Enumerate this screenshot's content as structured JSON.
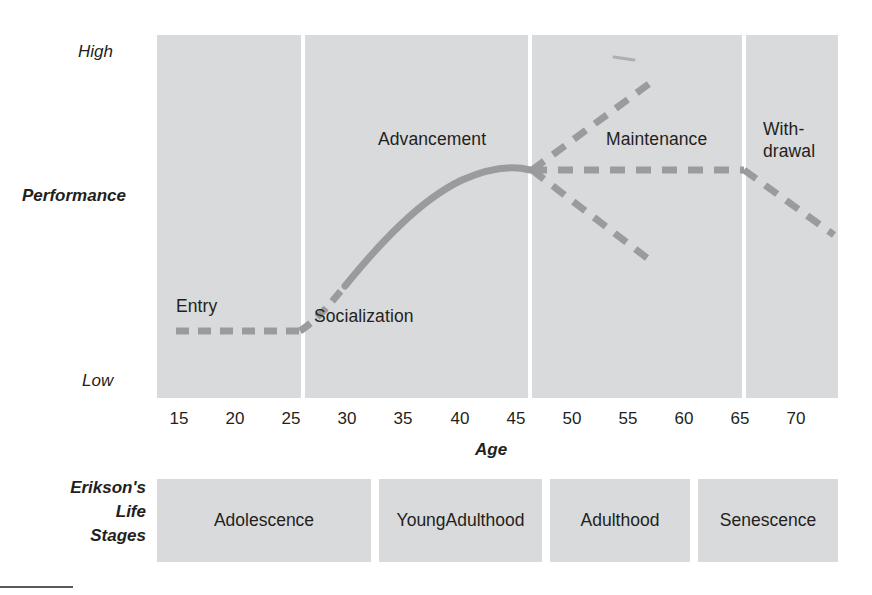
{
  "chart_data": {
    "type": "line",
    "title": "",
    "xlabel": "Age",
    "ylabel": "Performance",
    "xlim": [
      13,
      73
    ],
    "ylim": [
      0,
      1
    ],
    "x_ticks": [
      "15",
      "20",
      "25",
      "30",
      "35",
      "40",
      "45",
      "50",
      "55",
      "60",
      "65",
      "70"
    ],
    "y_ticks": [
      "High",
      "Low"
    ],
    "grid": false,
    "legend": "none",
    "annotations": [
      {
        "label": "Entry",
        "age_range": [
          15,
          25
        ]
      },
      {
        "label": "Socialization",
        "age_range": [
          25,
          30
        ]
      },
      {
        "label": "Advancement",
        "age_range": [
          25,
          45
        ]
      },
      {
        "label": "Maintenance",
        "age_range": [
          45,
          65
        ]
      },
      {
        "label": "With-\ndrawal",
        "age_range": [
          65,
          73
        ]
      }
    ],
    "career_boundaries": [
      25,
      45,
      65
    ],
    "series": [
      {
        "name": "Entry",
        "style": "dashed",
        "points": [
          [
            15,
            0.18
          ],
          [
            25,
            0.18
          ]
        ]
      },
      {
        "name": "Socialization / Advancement",
        "style": "dashed-to-solid",
        "points": [
          [
            25,
            0.18
          ],
          [
            30,
            0.4
          ],
          [
            35,
            0.58
          ],
          [
            40,
            0.7
          ],
          [
            45,
            0.745
          ]
        ]
      },
      {
        "name": "Maintenance - growth",
        "style": "dashed",
        "points": [
          [
            45,
            0.745
          ],
          [
            56,
            0.98
          ]
        ]
      },
      {
        "name": "Maintenance - plateau",
        "style": "dashed",
        "points": [
          [
            45,
            0.745
          ],
          [
            65,
            0.745
          ]
        ]
      },
      {
        "name": "Maintenance - decline",
        "style": "dashed",
        "points": [
          [
            45,
            0.745
          ],
          [
            56,
            0.5
          ]
        ]
      },
      {
        "name": "Withdrawal",
        "style": "dashed",
        "points": [
          [
            65,
            0.745
          ],
          [
            72.5,
            0.54
          ]
        ]
      }
    ]
  },
  "axis": {
    "y_high": "High",
    "y_low": "Low",
    "y_title": "Performance",
    "x_title": "Age",
    "x_ticks": [
      "15",
      "20",
      "25",
      "30",
      "35",
      "40",
      "45",
      "50",
      "55",
      "60",
      "65",
      "70"
    ]
  },
  "plot_labels": {
    "entry": "Entry",
    "socialization": "Socialization",
    "advancement": "Advancement",
    "maintenance": "Maintenance",
    "withdrawal_line1": "With-",
    "withdrawal_line2": "drawal"
  },
  "erikson": {
    "title_line1": "Erikson's",
    "title_line2": "Life",
    "title_line3": "Stages",
    "stages": [
      {
        "label": "Adolescence"
      },
      {
        "label": "Young\nAdulthood"
      },
      {
        "label": "Adulthood"
      },
      {
        "label": "Senescence"
      }
    ]
  },
  "colors": {
    "panel": "#d9dadb",
    "divider": "#ffffff",
    "curve": "#9a9b9d",
    "curve_solid": "#9a9b9d",
    "text": "#231f20",
    "rule": "#58595b",
    "background": "#ffffff"
  }
}
